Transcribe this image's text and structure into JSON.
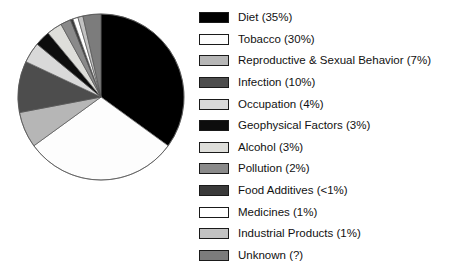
{
  "chart_data": {
    "type": "pie",
    "title": "",
    "subtitle": "",
    "xlabel": "",
    "ylabel": "",
    "grid": false,
    "legend_position": "right",
    "start_angle_deg": 0,
    "direction": "clockwise",
    "categories": [
      "Diet",
      "Tobacco",
      "Reproductive & Sexual Behavior",
      "Infection",
      "Occupation",
      "Geophysical Factors",
      "Alcohol",
      "Pollution",
      "Food Additives",
      "Medicines",
      "Industrial Products",
      "Unknown"
    ],
    "values": [
      35,
      30,
      7,
      10,
      4,
      3,
      3,
      2,
      0.5,
      1,
      1,
      3.5
    ],
    "value_labels": [
      "35%",
      "30%",
      "7%",
      "10%",
      "4%",
      "3%",
      "3%",
      "2%",
      "<1%",
      "1%",
      "1%",
      "?"
    ],
    "colors": [
      "#000000",
      "#fdfdfd",
      "#b6b6b6",
      "#4d4d4d",
      "#d9d9d9",
      "#0d0d0d",
      "#dededa",
      "#8a8a8a",
      "#3a3a3a",
      "#ffffff",
      "#c2c2c2",
      "#7c7c7c"
    ],
    "slice_order_clockwise": [
      "Diet",
      "Tobacco",
      "Reproductive & Sexual Behavior",
      "Infection",
      "Occupation",
      "Geophysical Factors",
      "Alcohol",
      "Pollution",
      "Food Additives",
      "Medicines",
      "Industrial Products",
      "Unknown"
    ]
  },
  "legend": {
    "items": [
      {
        "label": "Diet (35%)",
        "name": "diet",
        "color": "#000000"
      },
      {
        "label": "Tobacco (30%)",
        "name": "tobacco",
        "color": "#fdfdfd"
      },
      {
        "label": "Reproductive & Sexual Behavior (7%)",
        "name": "reproductive-sexual-behavior",
        "color": "#b6b6b6"
      },
      {
        "label": "Infection (10%)",
        "name": "infection",
        "color": "#4d4d4d"
      },
      {
        "label": "Occupation (4%)",
        "name": "occupation",
        "color": "#d9d9d9"
      },
      {
        "label": "Geophysical Factors (3%)",
        "name": "geophysical-factors",
        "color": "#0d0d0d"
      },
      {
        "label": "Alcohol (3%)",
        "name": "alcohol",
        "color": "#dededa"
      },
      {
        "label": "Pollution (2%)",
        "name": "pollution",
        "color": "#8a8a8a"
      },
      {
        "label": "Food Additives (<1%)",
        "name": "food-additives",
        "color": "#3a3a3a"
      },
      {
        "label": "Medicines (1%)",
        "name": "medicines",
        "color": "#ffffff"
      },
      {
        "label": "Industrial Products (1%)",
        "name": "industrial-products",
        "color": "#c2c2c2"
      },
      {
        "label": "Unknown (?)",
        "name": "unknown",
        "color": "#7c7c7c"
      }
    ]
  },
  "pie_geometry": {
    "center_x": 101,
    "center_y": 97,
    "radius": 83,
    "stroke": "#555555",
    "stroke_width": 0.7
  }
}
